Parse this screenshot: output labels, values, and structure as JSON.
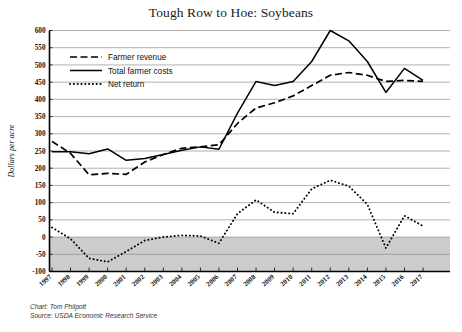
{
  "chart_data": {
    "type": "line",
    "title": "Tough Row to Hoe: Soybeans",
    "xlabel": "",
    "ylabel": "Dollars per acre",
    "ylim": [
      -100,
      600
    ],
    "ytick_step": 50,
    "yticks": [
      -100,
      -50,
      0,
      50,
      100,
      150,
      200,
      250,
      300,
      350,
      400,
      450,
      500,
      550,
      600
    ],
    "grid": true,
    "legend_position": "upper-left",
    "negative_band": {
      "from": -100,
      "to": 0,
      "color": "#c9c9c9"
    },
    "categories": [
      "1997",
      "1998",
      "1999",
      "2000",
      "2001",
      "2002",
      "2003",
      "2004",
      "2005",
      "2006",
      "2007",
      "2008",
      "2009",
      "2010",
      "2011",
      "2012",
      "2013",
      "2014",
      "2015",
      "2016",
      "2017"
    ],
    "series": [
      {
        "name": "Farmer revenue",
        "style": "dashed",
        "values": [
          278,
          243,
          181,
          185,
          182,
          218,
          240,
          258,
          262,
          268,
          330,
          375,
          390,
          410,
          440,
          470,
          478,
          470,
          452,
          455,
          452
        ]
      },
      {
        "name": "Total farmer costs",
        "style": "solid",
        "values": [
          248,
          248,
          242,
          256,
          223,
          228,
          240,
          252,
          262,
          255,
          360,
          452,
          440,
          452,
          510,
          600,
          570,
          510,
          420,
          490,
          455
        ]
      },
      {
        "name": "Net return",
        "style": "dotted",
        "values": [
          28,
          -5,
          -62,
          -72,
          -42,
          -10,
          0,
          5,
          3,
          -18,
          68,
          108,
          72,
          68,
          140,
          165,
          148,
          95,
          -32,
          62,
          32
        ]
      }
    ]
  },
  "legend": {
    "items": [
      {
        "label": "Farmer revenue",
        "style": "dashed"
      },
      {
        "label": "Total farmer costs",
        "style": "solid"
      },
      {
        "label": "Net return",
        "style": "dotted"
      }
    ]
  },
  "credits": {
    "chart_line": "Chart:  Tom Philpott",
    "source_line": "Source:  USDA Economic Research Service"
  }
}
